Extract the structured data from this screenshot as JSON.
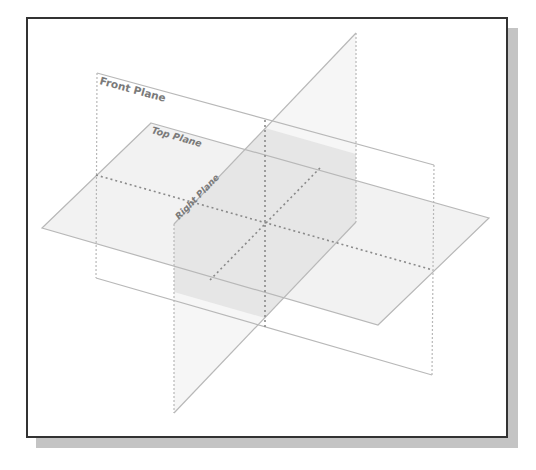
{
  "figure": {
    "planes": [
      {
        "name": "Front Plane",
        "label": "Front Plane"
      },
      {
        "name": "Top Plane",
        "label": "Top Plane"
      },
      {
        "name": "Right Plane",
        "label": "Right Plane"
      }
    ]
  },
  "labels": {
    "front": "Front Plane",
    "top": "Top Plane",
    "right": "Right Plane"
  },
  "colors": {
    "frame_border": "#333333",
    "shadow": "#c4c4c4",
    "plane_edge": "#b8b8b8",
    "plane_fill": "#f0f0f0",
    "overlap_fill": "#e4e4e4",
    "axis_dots": "#8a8a8a",
    "label_text": "#7a7a7a"
  }
}
